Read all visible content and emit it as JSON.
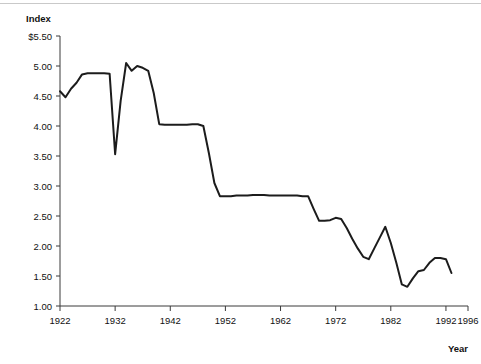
{
  "chart_data": {
    "type": "line",
    "title": "",
    "ylabel": "Index",
    "xlabel": "Year",
    "ylim": [
      1.0,
      5.5
    ],
    "xlim": [
      1922,
      1996
    ],
    "grid": false,
    "legend": "none",
    "y_tick_labels": [
      "$5.50",
      "5.00",
      "4.50",
      "4.00",
      "3.50",
      "3.00",
      "2.50",
      "2.00",
      "1.50",
      "1.00"
    ],
    "y_tick_values": [
      5.5,
      5.0,
      4.5,
      4.0,
      3.5,
      3.0,
      2.5,
      2.0,
      1.5,
      1.0
    ],
    "x_tick_labels": [
      "1922",
      "1932",
      "1942",
      "1952",
      "1962",
      "1972",
      "1982",
      "1992",
      "1996"
    ],
    "x_tick_values": [
      1922,
      1932,
      1942,
      1952,
      1962,
      1972,
      1982,
      1992,
      1996
    ],
    "series": [
      {
        "name": "Index",
        "color": "#1c1c1c",
        "line_width": 2,
        "x": [
          1922,
          1923,
          1924,
          1925,
          1926,
          1927,
          1928,
          1929,
          1930,
          1931,
          1932,
          1933,
          1934,
          1935,
          1936,
          1937,
          1938,
          1939,
          1940,
          1941,
          1942,
          1943,
          1944,
          1945,
          1946,
          1947,
          1948,
          1949,
          1950,
          1951,
          1952,
          1953,
          1954,
          1955,
          1956,
          1957,
          1958,
          1959,
          1960,
          1961,
          1962,
          1963,
          1964,
          1965,
          1966,
          1967,
          1968,
          1969,
          1970,
          1971,
          1972,
          1973,
          1974,
          1975,
          1976,
          1977,
          1978,
          1979,
          1980,
          1981,
          1982,
          1983,
          1984,
          1985,
          1986,
          1987,
          1988,
          1989,
          1990,
          1991,
          1992,
          1993
        ],
        "values": [
          4.58,
          4.48,
          4.62,
          4.72,
          4.86,
          4.88,
          4.88,
          4.88,
          4.88,
          4.87,
          3.53,
          4.42,
          5.05,
          4.92,
          5.0,
          4.97,
          4.92,
          4.55,
          4.03,
          4.02,
          4.02,
          4.02,
          4.02,
          4.02,
          4.03,
          4.03,
          4.0,
          3.55,
          3.05,
          2.83,
          2.83,
          2.83,
          2.84,
          2.84,
          2.84,
          2.85,
          2.85,
          2.85,
          2.84,
          2.84,
          2.84,
          2.84,
          2.84,
          2.84,
          2.83,
          2.83,
          2.62,
          2.42,
          2.42,
          2.43,
          2.47,
          2.45,
          2.3,
          2.12,
          1.96,
          1.82,
          1.78,
          1.96,
          2.14,
          2.32,
          2.05,
          1.72,
          1.36,
          1.32,
          1.46,
          1.58,
          1.6,
          1.72,
          1.8,
          1.8,
          1.78,
          1.55
        ]
      }
    ]
  },
  "axis": {
    "y_title": "Index",
    "x_title": "Year"
  }
}
